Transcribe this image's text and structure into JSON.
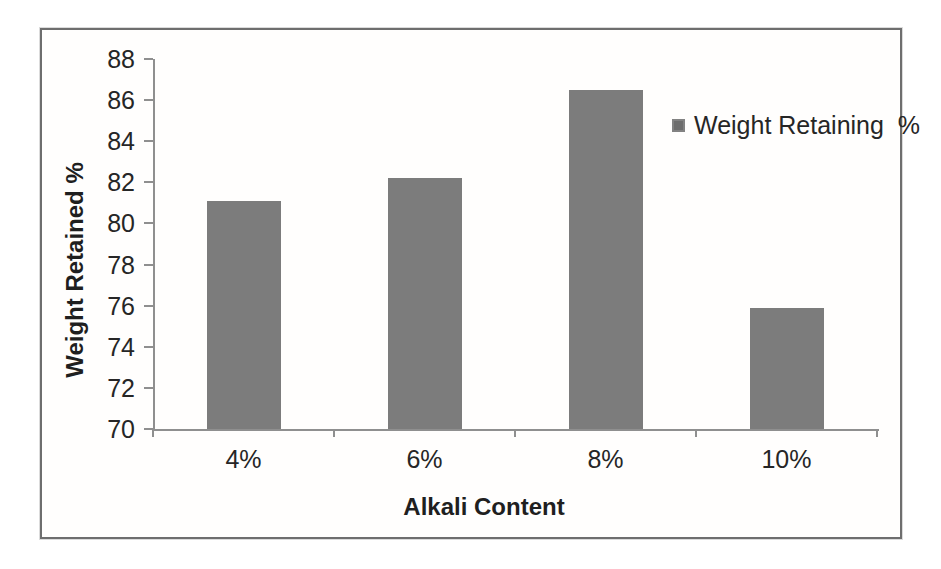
{
  "chart_data": {
    "type": "bar",
    "categories": [
      "4%",
      "6%",
      "8%",
      "10%"
    ],
    "values": [
      81.1,
      82.2,
      86.5,
      75.9
    ],
    "series_name": "Weight Retaining  %",
    "title": "",
    "xlabel": "Alkali Content",
    "ylabel": "Weight Retained %",
    "ylim": [
      70,
      88
    ],
    "yticks": [
      70,
      72,
      74,
      76,
      78,
      80,
      82,
      84,
      86,
      88
    ],
    "grid": false,
    "legend_position": "inside-top-right",
    "colors": {
      "bar": "#7c7c7c",
      "legend_swatch": "#6d6d6d",
      "axis": "#8f8f8f",
      "text": "#262626",
      "frame_border": "#6e6e6e"
    }
  }
}
